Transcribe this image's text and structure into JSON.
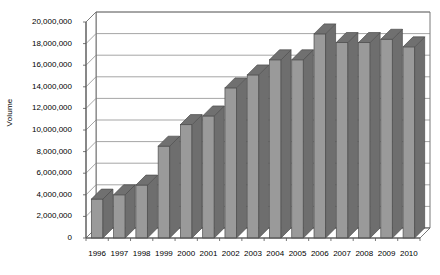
{
  "chart_data": {
    "type": "bar",
    "title": "",
    "subtitle": "",
    "xlabel": "",
    "ylabel": "Volume",
    "categories": [
      "1996",
      "1997",
      "1998",
      "1999",
      "2000",
      "2001",
      "2002",
      "2003",
      "2004",
      "2005",
      "2006",
      "2007",
      "2008",
      "2009",
      "2010"
    ],
    "values": [
      3600000,
      4000000,
      4900000,
      8500000,
      10500000,
      11300000,
      13900000,
      15100000,
      16500000,
      16500000,
      18900000,
      18100000,
      18100000,
      18400000,
      17700000
    ],
    "series": [
      {
        "name": "Volume",
        "values": [
          3600000,
          4000000,
          4900000,
          8500000,
          10500000,
          11300000,
          13900000,
          15100000,
          16500000,
          16500000,
          18900000,
          18100000,
          18100000,
          18400000,
          17700000
        ]
      }
    ],
    "ylim": [
      0,
      20000000
    ],
    "ytick_values": [
      0,
      2000000,
      4000000,
      6000000,
      8000000,
      10000000,
      12000000,
      14000000,
      16000000,
      18000000,
      20000000
    ],
    "ytick_labels": [
      "0",
      "2,000,000",
      "4,000,000",
      "6,000,000",
      "8,000,000",
      "10,000,000",
      "12,000,000",
      "14,000,000",
      "16,000,000",
      "18,000,000",
      "20,000,000"
    ],
    "grid": true,
    "grid_axis": "y",
    "legend": false,
    "legend_position": "none",
    "style": "3d-column",
    "annotations": []
  },
  "colors": {
    "bar_front": "#9a9a9a",
    "bar_side": "#6e6e6e",
    "bar_top": "#707070",
    "bar_outline": "#4d4d4d",
    "grid_line": "#808080",
    "axis_line": "#555555",
    "back_wall": "#ffffff",
    "floor": "#ffffff",
    "text": "#000000",
    "background": "#ffffff"
  }
}
